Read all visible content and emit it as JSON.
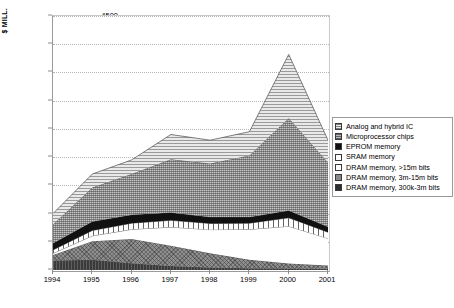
{
  "chart_data": {
    "type": "area",
    "stacked": true,
    "title": "",
    "xlabel": "",
    "ylabel": "$ MILL.",
    "categories": [
      "1994",
      "1995",
      "1996",
      "1997",
      "1998",
      "1999",
      "2000",
      "2001"
    ],
    "x": [
      1994,
      1995,
      1996,
      1997,
      1998,
      1999,
      2000,
      2001
    ],
    "ylim": [
      0,
      4500
    ],
    "yticks": [
      0,
      500,
      1000,
      1500,
      2000,
      2500,
      3000,
      3500,
      4000,
      4500
    ],
    "grid": true,
    "legend_position": "right",
    "series": [
      {
        "name": "DRAM memory, 300k-3m bits",
        "swatch": "dram300",
        "values": [
          170,
          180,
          120,
          70,
          45,
          30,
          25,
          20
        ]
      },
      {
        "name": "DRAM memory, 3m-15m bits",
        "swatch": "dram3",
        "values": [
          95,
          330,
          430,
          360,
          250,
          150,
          90,
          60
        ]
      },
      {
        "name": "DRAM memory, >15m bits",
        "swatch": "dram15",
        "values": [
          30,
          95,
          170,
          330,
          420,
          540,
          660,
          480
        ]
      },
      {
        "name": "SRAM memory",
        "swatch": "sram",
        "values": [
          60,
          95,
          110,
          120,
          110,
          110,
          150,
          110
        ]
      },
      {
        "name": "EPROM memory",
        "swatch": "eprom",
        "values": [
          120,
          160,
          150,
          140,
          115,
          110,
          130,
          95
        ]
      },
      {
        "name": "Microprocessor chips",
        "swatch": "micro",
        "values": [
          330,
          600,
          720,
          940,
          945,
          1090,
          1640,
          1140
        ]
      },
      {
        "name": "Analog and hybrid IC",
        "swatch": "analog",
        "values": [
          195,
          240,
          250,
          440,
          415,
          420,
          1125,
          395
        ]
      }
    ],
    "totals": [
      1000,
      1700,
      1950,
      2400,
      2300,
      2450,
      3820,
      2300
    ]
  },
  "legend": {
    "items": [
      {
        "label": "Analog and hybrid IC",
        "swatch": "analog"
      },
      {
        "label": "Microprocessor chips",
        "swatch": "micro"
      },
      {
        "label": "EPROM memory",
        "swatch": "eprom"
      },
      {
        "label": "SRAM memory",
        "swatch": "sram"
      },
      {
        "label": "DRAM memory, >15m bits",
        "swatch": "dram15"
      },
      {
        "label": "DRAM memory, 3m-15m bits",
        "swatch": "dram3"
      },
      {
        "label": "DRAM memory, 300k-3m bits",
        "swatch": "dram300"
      }
    ]
  },
  "colors": {
    "axis": "#8d8d8d",
    "grid": "#b5b5b5",
    "text": "#000000",
    "background": "#ffffff"
  }
}
